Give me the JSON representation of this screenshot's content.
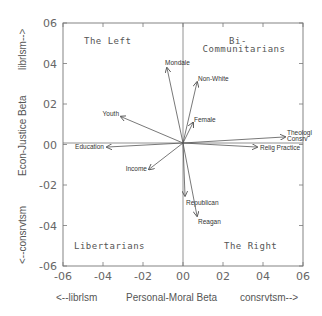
{
  "chart_data": {
    "type": "scatter",
    "subtype": "biplot-vectors",
    "title": "",
    "xlabel": "Personal-Moral Beta",
    "xlabel_left": "<--librlsm",
    "xlabel_right": "consrvtsm-->",
    "ylabel": "Econ-Justice Beta",
    "ylabel_top": "librlsm-->",
    "ylabel_bottom": "<--consrvtsm",
    "xlim": [
      -0.6,
      0.6
    ],
    "ylim": [
      -0.6,
      0.6
    ],
    "xticks": [
      "-06",
      "-04",
      "-02",
      "00",
      "02",
      "04",
      "06"
    ],
    "yticks": [
      "06",
      "04",
      "02",
      "00",
      "-02",
      "-04",
      "-06"
    ],
    "grid": false,
    "quadrant_labels": {
      "top_left": "The Left",
      "top_right_line1": "Bi-",
      "top_right_line2": "Communitarians",
      "bottom_left": "Libertarians",
      "bottom_right": "The Right"
    },
    "vectors": [
      {
        "name": "Mondale",
        "x": -0.08,
        "y": 0.37
      },
      {
        "name": "Non-White",
        "x": 0.07,
        "y": 0.3
      },
      {
        "name": "Female",
        "x": 0.05,
        "y": 0.1
      },
      {
        "name": "Youth",
        "x": -0.31,
        "y": 0.13
      },
      {
        "name": "Education",
        "x": -0.38,
        "y": -0.02
      },
      {
        "name": "Income",
        "x": -0.17,
        "y": -0.13
      },
      {
        "name": "Republican",
        "x": 0.01,
        "y": -0.26
      },
      {
        "name": "Reagan",
        "x": 0.07,
        "y": -0.36
      },
      {
        "name": "Theologl Consrv",
        "x": 0.51,
        "y": 0.03
      },
      {
        "name": "Relig Practice",
        "x": 0.37,
        "y": -0.02
      }
    ]
  }
}
